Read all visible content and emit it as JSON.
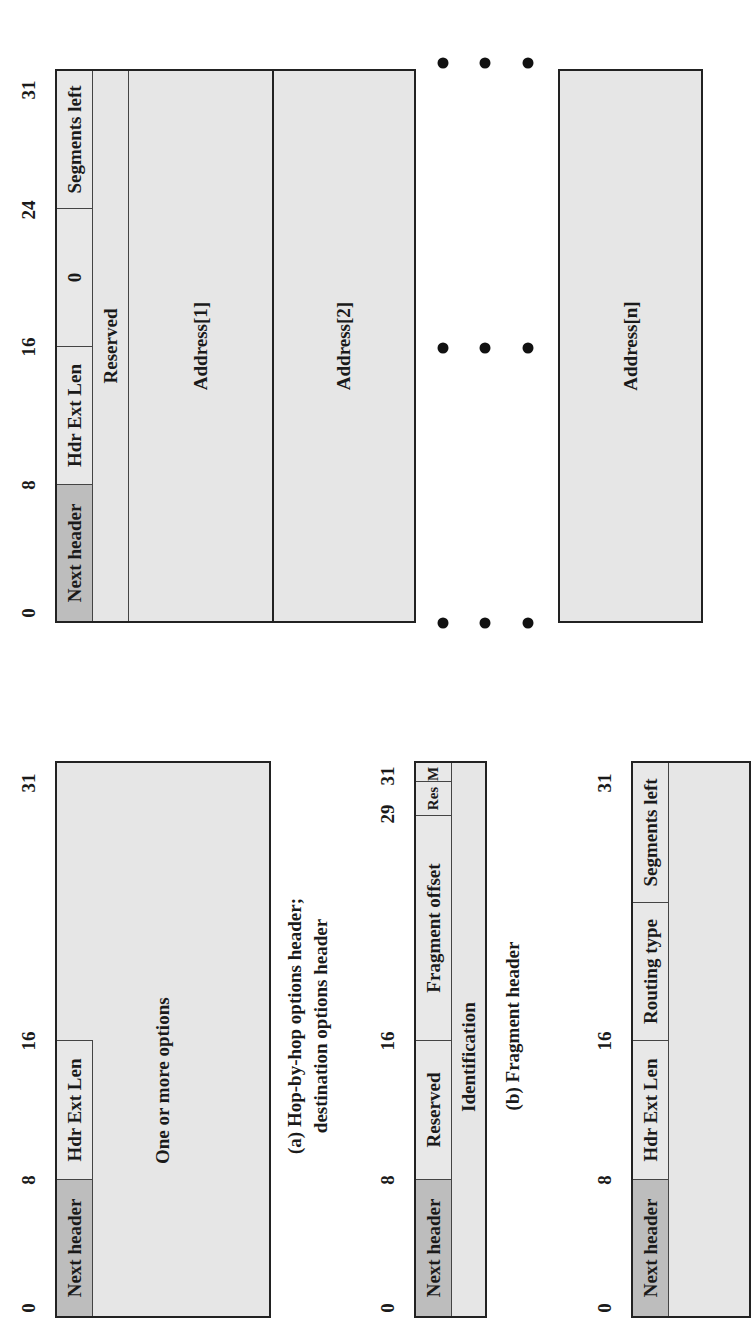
{
  "figure": {
    "hop_by_hop": {
      "ticks": [
        "0",
        "8",
        "16",
        "31"
      ],
      "fields": {
        "next_header": "Next header",
        "hdr_ext_len": "Hdr Ext Len",
        "body": "One or more options"
      },
      "caption_line1": "(a) Hop-by-hop options header;",
      "caption_line2": "destination options header"
    },
    "fragment": {
      "ticks": [
        "0",
        "8",
        "16",
        "29",
        "31"
      ],
      "fields": {
        "next_header": "Next header",
        "reserved": "Reserved",
        "fragment_offset": "Fragment offset",
        "res": "Res",
        "m": "M",
        "identification": "Identification"
      },
      "caption": "(b) Fragment header"
    },
    "routing_generic": {
      "ticks": [
        "0",
        "8",
        "16",
        "31"
      ],
      "fields": {
        "next_header": "Next header",
        "hdr_ext_len": "Hdr Ext Len",
        "routing_type": "Routing type",
        "segments_left": "Segments left"
      }
    },
    "routing_type0": {
      "ticks": [
        "0",
        "8",
        "16",
        "24",
        "31"
      ],
      "fields": {
        "next_header": "Next header",
        "hdr_ext_len": "Hdr Ext Len",
        "routing_type_value": "0",
        "segments_left": "Segments left",
        "reserved": "Reserved",
        "address_1": "Address[1]",
        "address_2": "Address[2]",
        "address_n": "Address[n]"
      },
      "ellipsis": "• • •"
    },
    "colors": {
      "dark_field": "#bdbdbd",
      "light_field": "#e8e8e8",
      "border": "#222222"
    }
  }
}
